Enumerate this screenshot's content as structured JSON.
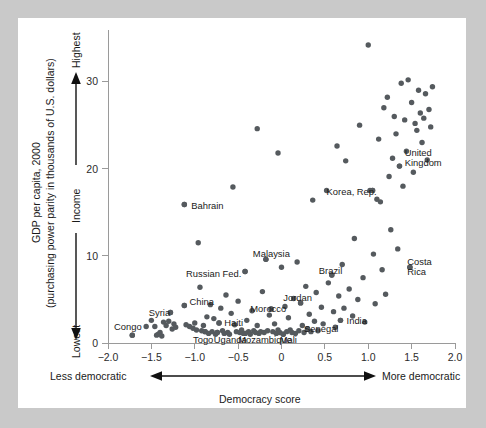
{
  "figure": {
    "background_color": "#c9c9c9",
    "card_color": "#ffffff",
    "dot_color": "#555a5e",
    "axis_color": "#9a9a9a"
  },
  "axes": {
    "y_title_line1": "GDP per capita, 2000",
    "y_title_line2": "(purchasing power parity in thousands of U.S. dollars)",
    "y_direction_label": "Income",
    "y_top_label": "Highest",
    "y_bottom_label": "Lowest",
    "x_title": "Democracy score",
    "x_left_label": "Less democratic",
    "x_right_label": "More democratic"
  },
  "chart_data": {
    "type": "scatter",
    "title": "",
    "xlabel": "Democracy score",
    "ylabel": "GDP per capita, 2000 (purchasing power parity in thousands of U.S. dollars)",
    "xlim": [
      -2.0,
      2.0
    ],
    "ylim": [
      0,
      35
    ],
    "xticks": [
      -2.0,
      -1.5,
      -1.0,
      -0.5,
      0,
      0.5,
      1.0,
      1.5,
      2.0
    ],
    "xticklabels": [
      "−2.0",
      "−1.5",
      "−1.0",
      "−0.5",
      "0",
      "0.5",
      "1.0",
      "1.5",
      "2.0"
    ],
    "yticks": [
      0,
      10,
      20,
      30
    ],
    "yticklabels": [
      "0",
      "10",
      "20",
      "30"
    ],
    "grid": false,
    "legend": "none",
    "annotations": [
      {
        "label": "Congo",
        "x": -1.72,
        "y": 0.9,
        "lx": -1.93,
        "ly": 1.9,
        "anchor": "start"
      },
      {
        "label": "Syria",
        "x": -1.28,
        "y": 3.5,
        "lx": -1.53,
        "ly": 3.5,
        "anchor": "start"
      },
      {
        "label": "China",
        "x": -1.12,
        "y": 4.3,
        "lx": -1.06,
        "ly": 4.8,
        "anchor": "start"
      },
      {
        "label": "Togo",
        "x": -0.88,
        "y": 1.3,
        "lx": -1.02,
        "ly": 0.35,
        "anchor": "start"
      },
      {
        "label": "Uganda",
        "x": -0.74,
        "y": 1.2,
        "lx": -0.78,
        "ly": 0.35,
        "anchor": "start"
      },
      {
        "label": "Haiti",
        "x": -0.72,
        "y": 2.3,
        "lx": -0.66,
        "ly": 2.3,
        "anchor": "start"
      },
      {
        "label": "Mozambique",
        "x": -0.42,
        "y": 1.1,
        "lx": -0.5,
        "ly": 0.35,
        "anchor": "start"
      },
      {
        "label": "Mali",
        "x": 0.02,
        "y": 1.0,
        "lx": -0.02,
        "ly": 0.35,
        "anchor": "start"
      },
      {
        "label": "Morocco",
        "x": -0.12,
        "y": 3.9,
        "lx": -0.36,
        "ly": 3.9,
        "anchor": "start"
      },
      {
        "label": "Russian Fed.",
        "x": -0.42,
        "y": 8.2,
        "lx": -1.1,
        "ly": 8.0,
        "anchor": "start"
      },
      {
        "label": "Bahrain",
        "x": -1.12,
        "y": 15.9,
        "lx": -1.04,
        "ly": 15.8,
        "anchor": "start"
      },
      {
        "label": "Malaysia",
        "x": -0.18,
        "y": 9.6,
        "lx": -0.33,
        "ly": 10.3,
        "anchor": "start"
      },
      {
        "label": "Jordan",
        "x": 0.22,
        "y": 4.6,
        "lx": 0.02,
        "ly": 5.2,
        "anchor": "start"
      },
      {
        "label": "Senegal",
        "x": 0.3,
        "y": 1.6,
        "lx": 0.26,
        "ly": 1.6,
        "anchor": "start"
      },
      {
        "label": "India",
        "x": 0.68,
        "y": 2.6,
        "lx": 0.75,
        "ly": 2.6,
        "anchor": "start"
      },
      {
        "label": "Brazil",
        "x": 0.58,
        "y": 7.8,
        "lx": 0.43,
        "ly": 8.3,
        "anchor": "start"
      },
      {
        "label": "Costa Rica",
        "x": 1.48,
        "y": 8.7,
        "lx": 1.45,
        "ly": 8.9,
        "anchor": "start"
      },
      {
        "label": "Korea, Rep.",
        "x": 1.05,
        "y": 17.5,
        "lx": 0.52,
        "ly": 17.4,
        "anchor": "start"
      },
      {
        "label": "United Kingdom",
        "x": 1.36,
        "y": 20.3,
        "lx": 1.42,
        "ly": 21.5,
        "anchor": "start"
      }
    ],
    "points": [
      {
        "x": -1.72,
        "y": 0.9
      },
      {
        "x": -1.56,
        "y": 1.9
      },
      {
        "x": -1.5,
        "y": 2.6
      },
      {
        "x": -1.46,
        "y": 1.9
      },
      {
        "x": -1.44,
        "y": 0.9
      },
      {
        "x": -1.42,
        "y": 1.0
      },
      {
        "x": -1.4,
        "y": 1.2
      },
      {
        "x": -1.38,
        "y": 0.8
      },
      {
        "x": -1.36,
        "y": 2.4
      },
      {
        "x": -1.33,
        "y": 2.0
      },
      {
        "x": -1.3,
        "y": 2.5
      },
      {
        "x": -1.28,
        "y": 3.5
      },
      {
        "x": -1.26,
        "y": 1.6
      },
      {
        "x": -1.24,
        "y": 2.2
      },
      {
        "x": -1.22,
        "y": 1.8
      },
      {
        "x": -1.12,
        "y": 4.3
      },
      {
        "x": -1.12,
        "y": 15.9
      },
      {
        "x": -1.1,
        "y": 2.1
      },
      {
        "x": -1.06,
        "y": 1.9
      },
      {
        "x": -1.02,
        "y": 1.7
      },
      {
        "x": -1.0,
        "y": 2.3
      },
      {
        "x": -0.98,
        "y": 1.5
      },
      {
        "x": -0.96,
        "y": 11.5
      },
      {
        "x": -0.94,
        "y": 6.4
      },
      {
        "x": -0.92,
        "y": 1.4
      },
      {
        "x": -0.9,
        "y": 2.0
      },
      {
        "x": -0.88,
        "y": 1.3
      },
      {
        "x": -0.86,
        "y": 3.0
      },
      {
        "x": -0.84,
        "y": 1.1
      },
      {
        "x": -0.82,
        "y": 4.4
      },
      {
        "x": -0.8,
        "y": 1.3
      },
      {
        "x": -0.78,
        "y": 2.8
      },
      {
        "x": -0.76,
        "y": 1.0
      },
      {
        "x": -0.74,
        "y": 1.2
      },
      {
        "x": -0.72,
        "y": 2.3
      },
      {
        "x": -0.7,
        "y": 4.0
      },
      {
        "x": -0.68,
        "y": 1.4
      },
      {
        "x": -0.66,
        "y": 1.1
      },
      {
        "x": -0.64,
        "y": 5.5
      },
      {
        "x": -0.62,
        "y": 1.2
      },
      {
        "x": -0.6,
        "y": 1.0
      },
      {
        "x": -0.58,
        "y": 3.4
      },
      {
        "x": -0.56,
        "y": 17.9
      },
      {
        "x": -0.54,
        "y": 2.1
      },
      {
        "x": -0.52,
        "y": 1.3
      },
      {
        "x": -0.5,
        "y": 4.8
      },
      {
        "x": -0.48,
        "y": 1.2
      },
      {
        "x": -0.46,
        "y": 1.5
      },
      {
        "x": -0.44,
        "y": 1.1
      },
      {
        "x": -0.42,
        "y": 8.2
      },
      {
        "x": -0.42,
        "y": 1.1
      },
      {
        "x": -0.4,
        "y": 2.6
      },
      {
        "x": -0.38,
        "y": 1.3
      },
      {
        "x": -0.36,
        "y": 1.0
      },
      {
        "x": -0.34,
        "y": 3.7
      },
      {
        "x": -0.32,
        "y": 1.4
      },
      {
        "x": -0.3,
        "y": 1.2
      },
      {
        "x": -0.28,
        "y": 24.6
      },
      {
        "x": -0.28,
        "y": 2.0
      },
      {
        "x": -0.26,
        "y": 1.1
      },
      {
        "x": -0.24,
        "y": 1.3
      },
      {
        "x": -0.22,
        "y": 5.9
      },
      {
        "x": -0.2,
        "y": 1.2
      },
      {
        "x": -0.18,
        "y": 9.6
      },
      {
        "x": -0.16,
        "y": 1.4
      },
      {
        "x": -0.14,
        "y": 3.2
      },
      {
        "x": -0.12,
        "y": 3.9
      },
      {
        "x": -0.1,
        "y": 1.3
      },
      {
        "x": -0.08,
        "y": 2.2
      },
      {
        "x": -0.06,
        "y": 1.1
      },
      {
        "x": -0.04,
        "y": 21.8
      },
      {
        "x": -0.04,
        "y": 1.5
      },
      {
        "x": -0.02,
        "y": 1.2
      },
      {
        "x": 0.0,
        "y": 8.7
      },
      {
        "x": 0.02,
        "y": 1.0
      },
      {
        "x": 0.04,
        "y": 4.2
      },
      {
        "x": 0.06,
        "y": 1.3
      },
      {
        "x": 0.08,
        "y": 2.9
      },
      {
        "x": 0.1,
        "y": 1.5
      },
      {
        "x": 0.12,
        "y": 1.2
      },
      {
        "x": 0.14,
        "y": 5.1
      },
      {
        "x": 0.16,
        "y": 1.1
      },
      {
        "x": 0.18,
        "y": 9.3
      },
      {
        "x": 0.2,
        "y": 1.4
      },
      {
        "x": 0.22,
        "y": 4.6
      },
      {
        "x": 0.24,
        "y": 2.0
      },
      {
        "x": 0.26,
        "y": 1.2
      },
      {
        "x": 0.28,
        "y": 6.5
      },
      {
        "x": 0.3,
        "y": 1.6
      },
      {
        "x": 0.32,
        "y": 3.3
      },
      {
        "x": 0.34,
        "y": 1.3
      },
      {
        "x": 0.36,
        "y": 16.4
      },
      {
        "x": 0.38,
        "y": 2.5
      },
      {
        "x": 0.4,
        "y": 5.8
      },
      {
        "x": 0.42,
        "y": 1.4
      },
      {
        "x": 0.46,
        "y": 4.1
      },
      {
        "x": 0.48,
        "y": 2.2
      },
      {
        "x": 0.52,
        "y": 17.5
      },
      {
        "x": 0.54,
        "y": 6.9
      },
      {
        "x": 0.58,
        "y": 7.8
      },
      {
        "x": 0.6,
        "y": 3.6
      },
      {
        "x": 0.62,
        "y": 1.8
      },
      {
        "x": 0.64,
        "y": 22.6
      },
      {
        "x": 0.66,
        "y": 5.4
      },
      {
        "x": 0.68,
        "y": 2.6
      },
      {
        "x": 0.7,
        "y": 9.0
      },
      {
        "x": 0.72,
        "y": 4.0
      },
      {
        "x": 0.74,
        "y": 20.9
      },
      {
        "x": 0.78,
        "y": 6.2
      },
      {
        "x": 0.82,
        "y": 3.1
      },
      {
        "x": 0.84,
        "y": 12.0
      },
      {
        "x": 0.88,
        "y": 5.0
      },
      {
        "x": 0.9,
        "y": 25.0
      },
      {
        "x": 0.94,
        "y": 7.5
      },
      {
        "x": 0.96,
        "y": 2.4
      },
      {
        "x": 1.0,
        "y": 34.2
      },
      {
        "x": 1.02,
        "y": 17.5
      },
      {
        "x": 1.05,
        "y": 17.5
      },
      {
        "x": 1.06,
        "y": 10.2
      },
      {
        "x": 1.08,
        "y": 4.5
      },
      {
        "x": 1.1,
        "y": 16.5
      },
      {
        "x": 1.12,
        "y": 23.4
      },
      {
        "x": 1.14,
        "y": 16.2
      },
      {
        "x": 1.16,
        "y": 8.4
      },
      {
        "x": 1.18,
        "y": 27.0
      },
      {
        "x": 1.2,
        "y": 5.6
      },
      {
        "x": 1.22,
        "y": 28.2
      },
      {
        "x": 1.24,
        "y": 19.1
      },
      {
        "x": 1.26,
        "y": 13.0
      },
      {
        "x": 1.28,
        "y": 21.2
      },
      {
        "x": 1.3,
        "y": 26.0
      },
      {
        "x": 1.32,
        "y": 24.0
      },
      {
        "x": 1.34,
        "y": 10.8
      },
      {
        "x": 1.36,
        "y": 20.3
      },
      {
        "x": 1.38,
        "y": 29.8
      },
      {
        "x": 1.4,
        "y": 18.0
      },
      {
        "x": 1.42,
        "y": 25.6
      },
      {
        "x": 1.44,
        "y": 22.0
      },
      {
        "x": 1.46,
        "y": 30.2
      },
      {
        "x": 1.48,
        "y": 8.7
      },
      {
        "x": 1.5,
        "y": 27.6
      },
      {
        "x": 1.52,
        "y": 19.6
      },
      {
        "x": 1.54,
        "y": 25.2
      },
      {
        "x": 1.56,
        "y": 24.4
      },
      {
        "x": 1.58,
        "y": 29.0
      },
      {
        "x": 1.6,
        "y": 26.4
      },
      {
        "x": 1.62,
        "y": 23.0
      },
      {
        "x": 1.64,
        "y": 25.8
      },
      {
        "x": 1.66,
        "y": 28.6
      },
      {
        "x": 1.68,
        "y": 21.0
      },
      {
        "x": 1.7,
        "y": 26.8
      },
      {
        "x": 1.72,
        "y": 24.8
      },
      {
        "x": 1.74,
        "y": 29.4
      }
    ]
  }
}
